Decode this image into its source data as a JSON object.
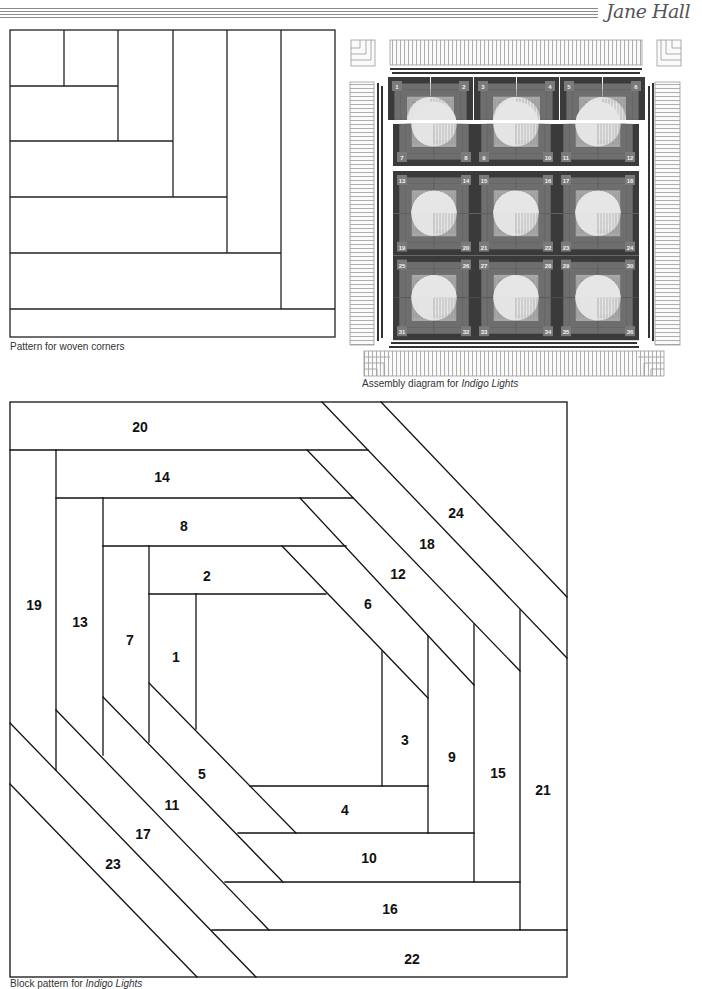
{
  "header": {
    "author": "Jane Hall",
    "rule_count": 4
  },
  "woven_corners": {
    "caption": "Pattern for woven corners",
    "strip_count": 11
  },
  "assembly": {
    "caption_prefix": "Assembly diagram for ",
    "caption_title": "Indigo Lights",
    "block_numbers": [
      "1",
      "2",
      "3",
      "4",
      "5",
      "6",
      "7",
      "8",
      "9",
      "10",
      "11",
      "12",
      "13",
      "14",
      "15",
      "16",
      "17",
      "18",
      "19",
      "20",
      "21",
      "22",
      "23",
      "24",
      "25",
      "26",
      "27",
      "28",
      "29",
      "30",
      "31",
      "32",
      "33",
      "34",
      "35",
      "36"
    ],
    "colors": {
      "dark": "#3a3a3a",
      "mid": "#6e6e6e",
      "light": "#e6e6e6",
      "label_bg": "#7a7a7a",
      "label_text": "#f2f2f2"
    }
  },
  "block_pattern": {
    "caption_prefix": "Block pattern for ",
    "caption_title": "Indigo Lights",
    "pieces": [
      {
        "n": "1",
        "x": 176,
        "y": 662
      },
      {
        "n": "2",
        "x": 207,
        "y": 581
      },
      {
        "n": "3",
        "x": 405,
        "y": 745
      },
      {
        "n": "4",
        "x": 345,
        "y": 815
      },
      {
        "n": "5",
        "x": 202,
        "y": 779
      },
      {
        "n": "6",
        "x": 368,
        "y": 609
      },
      {
        "n": "7",
        "x": 130,
        "y": 645
      },
      {
        "n": "8",
        "x": 184,
        "y": 531
      },
      {
        "n": "9",
        "x": 452,
        "y": 762
      },
      {
        "n": "10",
        "x": 369,
        "y": 863
      },
      {
        "n": "11",
        "x": 172,
        "y": 810
      },
      {
        "n": "12",
        "x": 398,
        "y": 579
      },
      {
        "n": "13",
        "x": 80,
        "y": 627
      },
      {
        "n": "14",
        "x": 162,
        "y": 482
      },
      {
        "n": "15",
        "x": 498,
        "y": 778
      },
      {
        "n": "16",
        "x": 390,
        "y": 914
      },
      {
        "n": "17",
        "x": 143,
        "y": 839
      },
      {
        "n": "18",
        "x": 427,
        "y": 549
      },
      {
        "n": "19",
        "x": 34,
        "y": 610
      },
      {
        "n": "20",
        "x": 140,
        "y": 432
      },
      {
        "n": "21",
        "x": 543,
        "y": 795
      },
      {
        "n": "22",
        "x": 412,
        "y": 964
      },
      {
        "n": "23",
        "x": 113,
        "y": 869
      },
      {
        "n": "24",
        "x": 456,
        "y": 518
      }
    ]
  }
}
